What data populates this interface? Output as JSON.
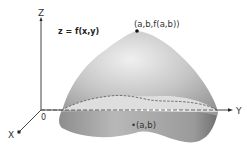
{
  "diagram": {
    "axes": {
      "z_label": "Z",
      "y_label": "Y",
      "x_label": "X",
      "origin_label": "0"
    },
    "equation_label": "z = f(x,y)",
    "max_point_label": "(a,b,f(a,b))",
    "base_point_label": "•(a,b)",
    "colors": {
      "surface_light": "#e8e8e8",
      "surface_mid": "#b5b5b5",
      "surface_dark": "#7a7a7a",
      "axis": "#444444",
      "dashed": "#555555"
    }
  }
}
